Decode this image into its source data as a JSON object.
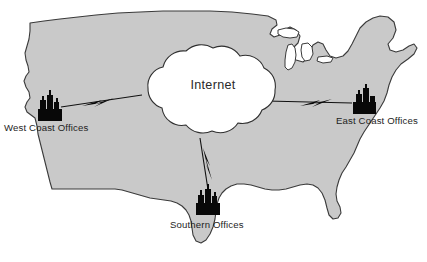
{
  "diagram": {
    "background_color": "#ffffff",
    "map": {
      "region_name": "United States",
      "land_fill_color": "#c9c9c9",
      "outline_color": "#3a3a3a",
      "lakes_fill_color": "#ffffff"
    },
    "cloud": {
      "label": "Internet",
      "fill_color": "#ffffff",
      "outline_color": "#2f2f2f"
    },
    "sites": [
      {
        "id": "west-coast",
        "label": "West Coast Offices",
        "icon": "factory-icon",
        "icon_color": "#080808"
      },
      {
        "id": "east-coast",
        "label": "East Coast Offices",
        "icon": "factory-icon",
        "icon_color": "#080808"
      },
      {
        "id": "southern",
        "label": "Southern Offices",
        "icon": "factory-icon",
        "icon_color": "#080808"
      }
    ],
    "links": [
      {
        "id": "west-link",
        "from": "west-coast",
        "to": "Internet",
        "style": "lightning-bolt"
      },
      {
        "id": "east-link",
        "from": "east-coast",
        "to": "Internet",
        "style": "lightning-bolt"
      },
      {
        "id": "south-link",
        "from": "southern",
        "to": "Internet",
        "style": "lightning-bolt"
      }
    ]
  }
}
